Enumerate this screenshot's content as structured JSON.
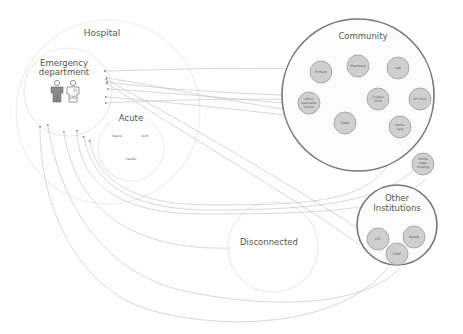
{
  "diagram": {
    "type": "patient-flow",
    "zones": {
      "hospital": {
        "label": "Hospital"
      },
      "emergency": {
        "label_line1": "Emergency",
        "label_line2": "department",
        "icons": [
          "patient-icon",
          "clinician-icon"
        ]
      },
      "acute": {
        "label": "Acute",
        "units": [
          "Neuro",
          "G/M",
          "Cardio"
        ]
      },
      "community": {
        "label": "Community",
        "nodes": [
          {
            "id": "primary",
            "lines": [
              "Primary"
            ]
          },
          {
            "id": "pharmacy",
            "lines": [
              "Pharmacy"
            ]
          },
          {
            "id": "lab",
            "lines": [
              "Lab"
            ]
          },
          {
            "id": "other-specialist",
            "lines": [
              "Other",
              "specialist",
              "clinics"
            ]
          },
          {
            "id": "tx-clinic",
            "lines": [
              "Tx/spec",
              "clinic"
            ]
          },
          {
            "id": "ap-clinic",
            "lines": [
              "AP clinic"
            ]
          },
          {
            "id": "sdac",
            "lines": [
              "SDAC"
            ]
          },
          {
            "id": "home-care",
            "lines": [
              "Home",
              "care"
            ]
          },
          {
            "id": "home-supported-housing",
            "lines": [
              "Home",
              "supp.",
              "housing"
            ]
          }
        ]
      },
      "other_institutions": {
        "label_line1": "Other",
        "label_line2": "Institutions",
        "nodes": [
          {
            "id": "ltc",
            "lines": [
              "LTC"
            ]
          },
          {
            "id": "rehab",
            "lines": [
              "Rehab"
            ]
          },
          {
            "id": "sdac-inst",
            "lines": [
              "SDAC"
            ]
          }
        ]
      },
      "disconnected": {
        "label": "Disconnected"
      }
    },
    "colors": {
      "zone_strong_stroke": "#777777",
      "node_fill": "#cfcfcf",
      "flow_stroke": "#bdbdbd",
      "zone_faint_stroke": "#ececec"
    }
  }
}
